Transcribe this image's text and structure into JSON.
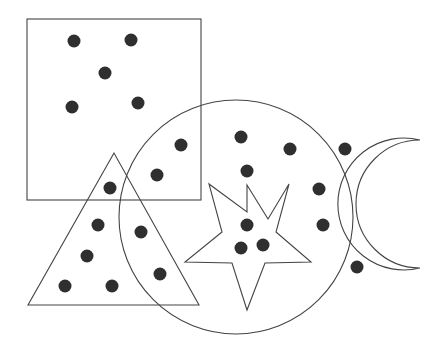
{
  "diagram": {
    "type": "venn-shapes-with-dots",
    "colors": {
      "stroke": "#444444",
      "dot": "#2f2f2f",
      "background": "#ffffff"
    },
    "shapes": [
      {
        "name": "square",
        "x": 27,
        "y": 19,
        "w": 174,
        "h": 181
      },
      {
        "name": "circle",
        "cx": 236,
        "cy": 217,
        "r": 117
      },
      {
        "name": "triangle",
        "points": "114,153 28,305 199,305"
      },
      {
        "name": "star",
        "points": "247,185 270,219 289,184 276,231 311,262 265,263 247,310 232,263 185,262 222,232 209,184 247,212"
      },
      {
        "name": "crescent-outer-circle",
        "cx": 356,
        "cy": 205,
        "r": 55
      },
      {
        "name": "crescent"
      }
    ],
    "dots": [
      {
        "region": "square",
        "x": 74,
        "y": 41
      },
      {
        "region": "square",
        "x": 131,
        "y": 40
      },
      {
        "region": "square",
        "x": 105,
        "y": 73
      },
      {
        "region": "square",
        "x": 72,
        "y": 107
      },
      {
        "region": "square",
        "x": 138,
        "y": 103
      },
      {
        "region": "square-circle",
        "x": 181,
        "y": 145
      },
      {
        "region": "square-circle",
        "x": 157,
        "y": 175
      },
      {
        "region": "square-triangle",
        "x": 110,
        "y": 188
      },
      {
        "region": "triangle",
        "x": 98,
        "y": 225
      },
      {
        "region": "triangle",
        "x": 87,
        "y": 256
      },
      {
        "region": "triangle",
        "x": 65,
        "y": 286
      },
      {
        "region": "triangle",
        "x": 112,
        "y": 286
      },
      {
        "region": "triangle-circle",
        "x": 141,
        "y": 232
      },
      {
        "region": "triangle-circle",
        "x": 160,
        "y": 274
      },
      {
        "region": "circle",
        "x": 241,
        "y": 137
      },
      {
        "region": "circle",
        "x": 290,
        "y": 149
      },
      {
        "region": "circle",
        "x": 247,
        "y": 171
      },
      {
        "region": "star-circle",
        "x": 247,
        "y": 225
      },
      {
        "region": "star-circle",
        "x": 241,
        "y": 248
      },
      {
        "region": "star-circle",
        "x": 263,
        "y": 245
      },
      {
        "region": "crescent-circle",
        "x": 319,
        "y": 189
      },
      {
        "region": "crescent-circle",
        "x": 323,
        "y": 225
      },
      {
        "region": "crescent",
        "x": 345,
        "y": 149
      },
      {
        "region": "crescent",
        "x": 357,
        "y": 267
      }
    ],
    "dot_radius": 6.5
  }
}
